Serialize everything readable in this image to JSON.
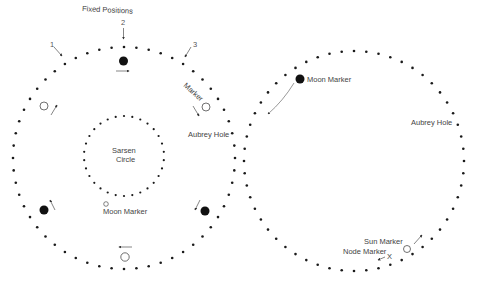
{
  "colors": {
    "background": "#ffffff",
    "dot": "#1a1a1a",
    "text": "#444444",
    "arrow": "#555555"
  },
  "left_diagram": {
    "title": "Fixed Positions",
    "position_labels": [
      "1",
      "2",
      "3"
    ],
    "aubrey_circle": {
      "cx": 124,
      "cy": 158,
      "r": 111,
      "holes": 56
    },
    "sarsen_circle": {
      "cx": 124,
      "cy": 156,
      "r": 40,
      "stones": 30,
      "label_line1": "Sarsen",
      "label_line2": "Circle"
    },
    "labels": {
      "marker": "Marker",
      "aubrey_hole": "Aubrey Hole",
      "moon_marker": "Moon Marker"
    },
    "markers": [
      {
        "type": "filled",
        "x": 124,
        "y": 60
      },
      {
        "type": "open",
        "x": 44,
        "y": 106
      },
      {
        "type": "open",
        "x": 206,
        "y": 108
      },
      {
        "type": "filled",
        "x": 44,
        "y": 210
      },
      {
        "type": "filled",
        "x": 206,
        "y": 211
      },
      {
        "type": "open",
        "x": 125,
        "y": 257
      },
      {
        "type": "open-small",
        "x": 106,
        "y": 204
      }
    ]
  },
  "right_diagram": {
    "aubrey_circle": {
      "cx": 354,
      "cy": 161,
      "r": 110,
      "holes": 56
    },
    "labels": {
      "moon_marker": "Moon Marker",
      "aubrey_hole": "Aubrey Hole",
      "sun_marker": "Sun Marker",
      "node_marker": "Node Marker",
      "node_symbol": "X"
    },
    "markers": [
      {
        "type": "filled",
        "x": 300,
        "y": 79
      },
      {
        "type": "open",
        "x": 407,
        "y": 249
      }
    ]
  }
}
